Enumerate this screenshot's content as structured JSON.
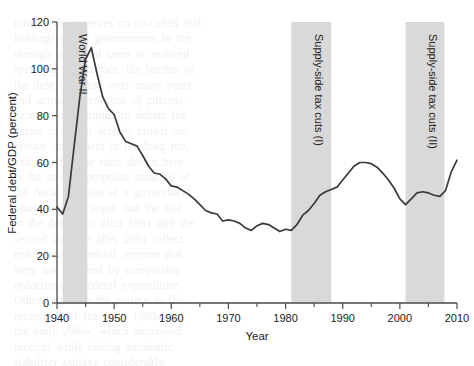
{
  "figure": {
    "background_color": "#ffffff",
    "band_color": "#d9d9d9",
    "line_color": "#3a3a3a"
  },
  "bleed_text": [
    "now to the reserves on so-called real",
    "holdings of the governments in the",
    "through increased taxes or reduced",
    "spending. In practice, the burden of",
    "the debt is spread over many years",
    "and across generations of citizens.",
    "Economists continue to debate the",
    "extent to which deficits crowd out",
    "private investment in the long run,",
    "and whether the ratio shown here",
    "is the most appropriate measure of",
    "the fiscal position of a government.",
    "",
    "Many analysts argue that the rise",
    "in the debt ratio after 1981 and the",
    "second increase after 2001 reflect",
    "reductions in federal revenue that",
    "were not matched by comparable",
    "reductions in federal expenditure.",
    "Others attribute the pattern to the",
    "recessions of the early 1980s and",
    "the early 2000s, which depressed",
    "receipts while raising automatic",
    "stabilizer outlays considerably."
  ],
  "chart_data": {
    "type": "line",
    "title": "",
    "xlabel": "Year",
    "ylabel": "Federal debt/GDP (percent)",
    "xlim": [
      1940,
      2010
    ],
    "ylim": [
      0,
      120
    ],
    "xticks": [
      1940,
      1950,
      1960,
      1970,
      1980,
      1990,
      2000,
      2010
    ],
    "xtick_labels": [
      "1940",
      "1950",
      "1960",
      "1970",
      "1980",
      "1990",
      "2000",
      "2010"
    ],
    "xminor_ticks": [
      1945,
      1955,
      1965,
      1975,
      1985,
      1995,
      2005
    ],
    "yticks": [
      0,
      20,
      40,
      60,
      80,
      100,
      120
    ],
    "ytick_labels": [
      "0",
      "20",
      "40",
      "60",
      "80",
      "100",
      "120"
    ],
    "grid": false,
    "legend": false,
    "series": [
      {
        "name": "Federal debt/GDP",
        "x": [
          1940,
          1941,
          1942,
          1943,
          1944,
          1945,
          1946,
          1947,
          1948,
          1949,
          1950,
          1951,
          1952,
          1953,
          1954,
          1955,
          1956,
          1957,
          1958,
          1959,
          1960,
          1961,
          1962,
          1963,
          1964,
          1965,
          1966,
          1967,
          1968,
          1969,
          1970,
          1971,
          1972,
          1973,
          1974,
          1975,
          1976,
          1977,
          1978,
          1979,
          1980,
          1981,
          1982,
          1983,
          1984,
          1985,
          1986,
          1987,
          1988,
          1989,
          1990,
          1991,
          1992,
          1993,
          1994,
          1995,
          1996,
          1997,
          1998,
          1999,
          2000,
          2001,
          2002,
          2003,
          2004,
          2005,
          2006,
          2007,
          2008,
          2009,
          2010
        ],
        "y": [
          41.0,
          38.0,
          45.5,
          67.0,
          88.0,
          104.0,
          109.0,
          98.0,
          88.0,
          83.0,
          80.5,
          73.0,
          69.0,
          68.0,
          67.0,
          63.0,
          58.5,
          55.5,
          55.0,
          53.0,
          50.0,
          49.5,
          48.0,
          46.5,
          44.5,
          42.0,
          39.5,
          38.5,
          38.0,
          35.0,
          35.5,
          35.0,
          34.0,
          32.0,
          31.0,
          33.0,
          34.0,
          33.5,
          32.0,
          30.5,
          31.5,
          31.0,
          33.5,
          37.5,
          39.5,
          42.5,
          46.0,
          47.5,
          48.5,
          49.5,
          52.5,
          55.5,
          58.5,
          60.0,
          60.0,
          59.5,
          58.0,
          55.5,
          52.5,
          49.0,
          44.5,
          42.0,
          44.5,
          47.0,
          47.5,
          47.0,
          46.0,
          45.5,
          48.0,
          56.0,
          61.0
        ]
      }
    ],
    "shaded_bands": [
      {
        "label": "World War II",
        "start": 1941,
        "end": 1945.3
      },
      {
        "label": "Supply-side tax cuts (I)",
        "start": 1981,
        "end": 1988
      },
      {
        "label": "Supply-side tax cuts (II)",
        "start": 2001,
        "end": 2007.8
      }
    ]
  }
}
